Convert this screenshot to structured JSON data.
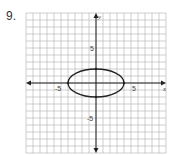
{
  "problem": {
    "number": "9."
  },
  "chart_data": {
    "type": "line",
    "title": "",
    "xlabel": "x",
    "ylabel": "y",
    "xlim": [
      -10,
      10
    ],
    "ylim": [
      -10,
      10
    ],
    "grid": true,
    "grid_step": 1,
    "x_tick_labels": [
      {
        "value": -5,
        "label": "-5"
      },
      {
        "value": 5,
        "label": "5"
      }
    ],
    "y_tick_labels": [
      {
        "value": 5,
        "label": "5"
      },
      {
        "value": -5,
        "label": "-5"
      }
    ],
    "series": [
      {
        "name": "ellipse",
        "shape": "ellipse",
        "center": [
          0,
          0
        ],
        "semi_axis_x": 4,
        "semi_axis_y": 2,
        "vertices": [
          [
            -4,
            0
          ],
          [
            4,
            0
          ],
          [
            0,
            2
          ],
          [
            0,
            -2
          ]
        ]
      }
    ]
  }
}
